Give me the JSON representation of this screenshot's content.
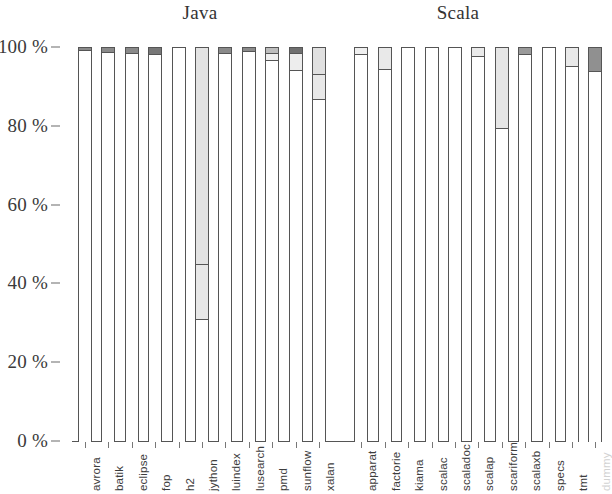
{
  "chart_data": {
    "type": "bar",
    "subtype": "stacked-bar",
    "title": "",
    "xlabel": "",
    "ylabel": "",
    "ylim": [
      0,
      100
    ],
    "ytick_labels": [
      "0 %",
      "20 %",
      "40 %",
      "60 %",
      "80 %",
      "100 %"
    ],
    "ytick_values": [
      0,
      20,
      40,
      60,
      80,
      100
    ],
    "grid": false,
    "legend": "none",
    "group_titles": [
      "Java",
      "Scala"
    ],
    "groups": [
      {
        "name": "Java",
        "categories": [
          "avrora",
          "batik",
          "eclipse",
          "fop",
          "h2",
          "jython",
          "luindex",
          "lusearch",
          "pmd",
          "sunflow",
          "xalan"
        ]
      },
      {
        "name": "Scala",
        "categories": [
          "apparat",
          "factorie",
          "kiama",
          "scalac",
          "scaladoc",
          "scalap",
          "scariform",
          "scalaxb",
          "specs",
          "tmt",
          "dummy"
        ]
      }
    ],
    "categories": [
      "avrora",
      "batik",
      "eclipse",
      "fop",
      "h2",
      "jython",
      "luindex",
      "lusearch",
      "pmd",
      "sunflow",
      "xalan",
      "apparat",
      "factorie",
      "kiama",
      "scalac",
      "scaladoc",
      "scalap",
      "scariform",
      "scalaxb",
      "specs",
      "tmt",
      "dummy"
    ],
    "bars": [
      {
        "label": "avrora",
        "group": "Java",
        "top": 100,
        "segments": [
          {
            "from": 99.2,
            "to": 100,
            "fill": "#8a8a8a"
          },
          {
            "from": 0,
            "to": 99.2,
            "fill": "#ffffff"
          }
        ]
      },
      {
        "label": "batik",
        "group": "Java",
        "top": 100,
        "segments": [
          {
            "from": 98.8,
            "to": 100,
            "fill": "#8a8a8a"
          },
          {
            "from": 0,
            "to": 98.8,
            "fill": "#ffffff"
          }
        ]
      },
      {
        "label": "eclipse",
        "group": "Java",
        "top": 100,
        "segments": [
          {
            "from": 98.4,
            "to": 100,
            "fill": "#8a8a8a"
          },
          {
            "from": 0,
            "to": 98.4,
            "fill": "#ffffff"
          }
        ]
      },
      {
        "label": "fop",
        "group": "Java",
        "top": 100,
        "segments": [
          {
            "from": 98.2,
            "to": 100,
            "fill": "#777777"
          },
          {
            "from": 0,
            "to": 98.2,
            "fill": "#ffffff"
          }
        ]
      },
      {
        "label": "h2",
        "group": "Java",
        "top": 100,
        "segments": [
          {
            "from": 0,
            "to": 100,
            "fill": "#ffffff"
          }
        ]
      },
      {
        "label": "jython",
        "group": "Java",
        "top": 100,
        "segments": [
          {
            "from": 45,
            "to": 100,
            "fill": "#e3e3e3"
          },
          {
            "from": 31,
            "to": 45,
            "fill": "#e8e8e8"
          },
          {
            "from": 0,
            "to": 31,
            "fill": "#ffffff"
          }
        ]
      },
      {
        "label": "luindex",
        "group": "Java",
        "top": 100,
        "segments": [
          {
            "from": 98.6,
            "to": 100,
            "fill": "#8a8a8a"
          },
          {
            "from": 0,
            "to": 98.6,
            "fill": "#ffffff"
          }
        ]
      },
      {
        "label": "lusearch",
        "group": "Java",
        "top": 100,
        "segments": [
          {
            "from": 98.9,
            "to": 100,
            "fill": "#8a8a8a"
          },
          {
            "from": 0,
            "to": 98.9,
            "fill": "#ffffff"
          }
        ]
      },
      {
        "label": "pmd",
        "group": "Java",
        "top": 100,
        "segments": [
          {
            "from": 98.6,
            "to": 100,
            "fill": "#bdbdbd"
          },
          {
            "from": 96.6,
            "to": 98.6,
            "fill": "#f0f0f0"
          },
          {
            "from": 0,
            "to": 96.6,
            "fill": "#ffffff"
          }
        ]
      },
      {
        "label": "sunflow",
        "group": "Java",
        "top": 100,
        "segments": [
          {
            "from": 98.6,
            "to": 100,
            "fill": "#6f6f6f"
          },
          {
            "from": 94.2,
            "to": 98.6,
            "fill": "#ededed"
          },
          {
            "from": 0,
            "to": 94.2,
            "fill": "#ffffff"
          }
        ]
      },
      {
        "label": "xalan",
        "group": "Java",
        "top": 100,
        "segments": [
          {
            "from": 93.2,
            "to": 100,
            "fill": "#e0e0e0"
          },
          {
            "from": 86.8,
            "to": 93.2,
            "fill": "#e8e8e8"
          },
          {
            "from": 0,
            "to": 86.8,
            "fill": "#ffffff"
          }
        ]
      },
      {
        "label": "apparat",
        "group": "Scala",
        "top": 100,
        "segments": [
          {
            "from": 98.2,
            "to": 100,
            "fill": "#efefef"
          },
          {
            "from": 0,
            "to": 98.2,
            "fill": "#ffffff"
          }
        ]
      },
      {
        "label": "factorie",
        "group": "Scala",
        "top": 100,
        "segments": [
          {
            "from": 94.3,
            "to": 100,
            "fill": "#e9e9e9"
          },
          {
            "from": 0,
            "to": 94.3,
            "fill": "#ffffff"
          }
        ]
      },
      {
        "label": "kiama",
        "group": "Scala",
        "top": 100,
        "segments": [
          {
            "from": 0,
            "to": 100,
            "fill": "#ffffff"
          }
        ]
      },
      {
        "label": "scalac",
        "group": "Scala",
        "top": 100,
        "segments": [
          {
            "from": 0,
            "to": 100,
            "fill": "#ffffff"
          }
        ]
      },
      {
        "label": "scaladoc",
        "group": "Scala",
        "top": 100,
        "segments": [
          {
            "from": 0,
            "to": 100,
            "fill": "#ffffff"
          }
        ]
      },
      {
        "label": "scalap",
        "group": "Scala",
        "top": 100,
        "segments": [
          {
            "from": 97.8,
            "to": 100,
            "fill": "#eaeaea"
          },
          {
            "from": 0,
            "to": 97.8,
            "fill": "#ffffff"
          }
        ]
      },
      {
        "label": "scariform",
        "group": "Scala",
        "top": 100,
        "segments": [
          {
            "from": 79.4,
            "to": 100,
            "fill": "#e6e6e6"
          },
          {
            "from": 0,
            "to": 79.4,
            "fill": "#ffffff"
          }
        ]
      },
      {
        "label": "scalaxb",
        "group": "Scala",
        "top": 100,
        "segments": [
          {
            "from": 98.2,
            "to": 100,
            "fill": "#9a9a9a"
          },
          {
            "from": 0,
            "to": 98.2,
            "fill": "#ffffff"
          }
        ]
      },
      {
        "label": "specs",
        "group": "Scala",
        "top": 100,
        "segments": [
          {
            "from": 0,
            "to": 100,
            "fill": "#ffffff"
          }
        ]
      },
      {
        "label": "tmt",
        "group": "Scala",
        "top": 100,
        "segments": [
          {
            "from": 95.2,
            "to": 100,
            "fill": "#e9e9e9"
          },
          {
            "from": 0,
            "to": 95.2,
            "fill": "#ffffff"
          }
        ]
      },
      {
        "label": "dummy",
        "group": "Scala",
        "top": 100,
        "segments": [
          {
            "from": 94.0,
            "to": 100,
            "fill": "#909090"
          },
          {
            "from": 0,
            "to": 94.0,
            "fill": "#ffffff"
          }
        ]
      }
    ]
  },
  "layout": {
    "plot_left": 72,
    "plot_right": 579,
    "y_top_px": 47,
    "y_bottom_px": 441,
    "bar_width": 14,
    "bar_gap": 9.4,
    "group_gap": 19,
    "title_java_x": 200,
    "title_scala_x": 458
  },
  "colors": {
    "axis": "#555555",
    "text": "#333333",
    "bar_border": "#555555",
    "faded_label": "#d2d2d2"
  }
}
